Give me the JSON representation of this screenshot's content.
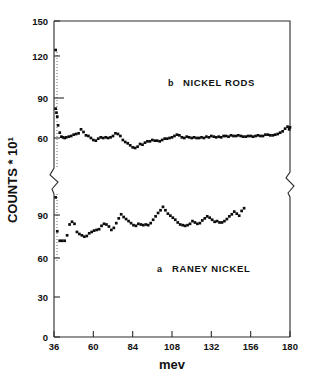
{
  "chart_data": {
    "type": "scatter",
    "title": "",
    "xlabel": "mev",
    "ylabel": "COUNTS * 10",
    "ylabel_exponent": "1",
    "grid": false,
    "legend_position": "inside-plot",
    "broken_axis": true,
    "xlim": [
      36,
      180
    ],
    "xticks": [
      36,
      60,
      84,
      108,
      132,
      156,
      180
    ],
    "xtick_labels": [
      "36",
      "60",
      "84",
      "108",
      "132",
      "156",
      "180"
    ],
    "upper_panel": {
      "label_letter": "b",
      "label_text": "NICKEL RODS",
      "ylim": [
        45,
        158
      ],
      "yticks": [
        60,
        90,
        120,
        150
      ],
      "ytick_labels": [
        "60",
        "90",
        "120",
        "150"
      ],
      "x": [
        37.0,
        37.0,
        37.5,
        38.0,
        38.5,
        39.5,
        40.5,
        41.5,
        42.5,
        43.5,
        45.0,
        46.5,
        48.0,
        49.5,
        51.0,
        52.5,
        54.0,
        55.5,
        57.0,
        58.5,
        60.0,
        61.5,
        63.0,
        64.5,
        66.0,
        67.5,
        69.0,
        70.5,
        72.0,
        73.5,
        75.0,
        76.5,
        78.0,
        79.5,
        81.0,
        82.5,
        84.0,
        85.5,
        87.0,
        88.5,
        90.0,
        91.5,
        93.0,
        94.5,
        96.0,
        97.5,
        99.0,
        100.5,
        102.0,
        103.5,
        105.0,
        106.5,
        108.0,
        109.5,
        111.0,
        112.5,
        114.0,
        115.5,
        117.0,
        118.5,
        120.0,
        121.5,
        123.0,
        124.5,
        126.0,
        127.5,
        129.0,
        130.5,
        132.0,
        133.5,
        135.0,
        136.5,
        138.0,
        139.5,
        141.0,
        142.5,
        144.0,
        145.5,
        147.0,
        148.5,
        150.0,
        151.5,
        153.0,
        154.5,
        156.0,
        157.5,
        159.0,
        160.5,
        162.0,
        163.5,
        165.0,
        166.5,
        168.0,
        169.5,
        171.0,
        172.5,
        174.0,
        175.5,
        177.0,
        178.5,
        179.5,
        180.0
      ],
      "y": [
        126.0,
        82.0,
        79.0,
        76.0,
        69.5,
        64.0,
        61.0,
        60.5,
        60.0,
        60.5,
        61.0,
        61.5,
        62.5,
        63.0,
        63.5,
        66.5,
        64.5,
        62.0,
        61.5,
        60.0,
        58.5,
        58.0,
        59.5,
        60.5,
        60.0,
        60.5,
        60.0,
        60.5,
        61.5,
        63.5,
        63.0,
        61.5,
        58.5,
        57.0,
        56.0,
        54.5,
        53.0,
        52.5,
        53.5,
        55.5,
        55.0,
        56.5,
        57.5,
        57.5,
        58.5,
        58.0,
        58.0,
        57.5,
        58.5,
        59.5,
        59.5,
        60.0,
        60.5,
        61.5,
        62.5,
        62.0,
        60.5,
        60.0,
        61.0,
        60.5,
        60.0,
        60.5,
        60.0,
        60.0,
        60.5,
        60.0,
        61.0,
        60.5,
        61.5,
        61.0,
        60.5,
        61.0,
        60.5,
        61.5,
        61.5,
        61.0,
        62.0,
        61.5,
        61.5,
        62.0,
        61.5,
        61.0,
        61.0,
        61.5,
        61.5,
        61.0,
        61.5,
        62.0,
        61.5,
        61.5,
        62.5,
        62.5,
        62.0,
        62.0,
        62.5,
        63.0,
        64.0,
        65.0,
        67.0,
        68.5,
        66.5,
        68.0
      ]
    },
    "lower_panel": {
      "label_letter": "a",
      "label_text": "RANEY NICKEL",
      "ylim": [
        0,
        105
      ],
      "yticks": [
        0,
        30,
        60,
        90
      ],
      "ytick_labels": [
        "0",
        "30",
        "60",
        "90"
      ],
      "x": [
        37.0,
        38.0,
        39.5,
        41.0,
        42.5,
        44.0,
        45.5,
        47.0,
        48.5,
        50.0,
        51.5,
        53.0,
        54.5,
        56.0,
        57.5,
        59.0,
        60.5,
        62.0,
        63.5,
        65.0,
        66.5,
        68.0,
        69.5,
        71.0,
        72.5,
        74.0,
        75.5,
        77.0,
        78.5,
        80.0,
        81.5,
        83.0,
        84.5,
        86.0,
        87.5,
        89.0,
        90.5,
        92.0,
        93.5,
        95.0,
        96.5,
        98.0,
        99.5,
        101.0,
        102.5,
        104.0,
        105.5,
        107.0,
        108.5,
        110.0,
        111.5,
        113.0,
        114.5,
        116.0,
        117.5,
        119.0,
        120.5,
        122.0,
        123.5,
        125.0,
        126.5,
        128.0,
        129.5,
        131.0,
        132.5,
        134.0,
        135.5,
        137.0,
        138.5,
        140.0,
        141.5,
        143.0,
        144.5,
        146.0,
        147.5,
        149.0,
        150.5,
        152.0,
        153.5,
        155.0,
        156.5,
        158.0,
        159.5,
        161.0,
        162.5,
        164.0,
        165.5,
        167.0,
        168.5,
        170.0,
        171.5,
        173.0,
        174.5,
        176.0,
        177.5,
        179.0,
        180.0
      ],
      "y": [
        103.0,
        78.0,
        71.0,
        71.0,
        71.0,
        75.0,
        83.0,
        85.0,
        83.5,
        77.5,
        76.0,
        75.0,
        74.0,
        74.5,
        76.5,
        77.5,
        78.5,
        79.0,
        79.5,
        82.0,
        83.5,
        83.0,
        81.5,
        79.0,
        80.5,
        84.0,
        87.5,
        90.5,
        88.5,
        87.0,
        85.5,
        84.0,
        82.5,
        82.0,
        83.5,
        83.0,
        82.5,
        83.0,
        82.5,
        84.0,
        86.5,
        89.0,
        91.5,
        93.5,
        96.0,
        93.5,
        91.0,
        89.5,
        88.0,
        86.5,
        84.5,
        83.0,
        82.5,
        82.0,
        82.5,
        83.5,
        85.5,
        84.5,
        83.5,
        84.0,
        86.0,
        87.5,
        89.0,
        88.0,
        86.5,
        85.0,
        85.5,
        84.5,
        84.5,
        85.5,
        87.0,
        89.0,
        90.5,
        92.5,
        91.0,
        89.5,
        93.0,
        95.0
      ]
    }
  },
  "axis": {
    "y_title_main": "COUNTS * 10",
    "y_title_exp": "1",
    "x_title": "mev"
  }
}
